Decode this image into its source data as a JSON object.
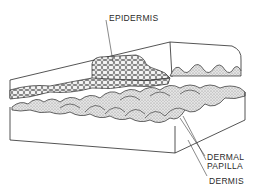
{
  "diagram": {
    "labels": {
      "epidermis": "EPIDERMIS",
      "dermal_papilla_line1": "DERMAL",
      "dermal_papilla_line2": "PAPILLA",
      "dermis": "DERMIS"
    },
    "colors": {
      "ink": "#2a2a2a",
      "stipple_fill": "#d6d6d6",
      "background": "#ffffff"
    }
  }
}
